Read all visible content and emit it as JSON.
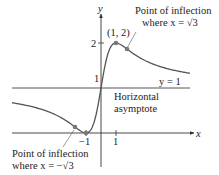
{
  "chart_data": {
    "type": "line",
    "title": "",
    "function": "f(x) = (x+1)^2 / (x^2+1)",
    "xlabel": "x",
    "ylabel": "y",
    "xlim": [
      -6.5,
      7.8
    ],
    "ylim": [
      -0.3,
      2.9
    ],
    "grid": false,
    "x_ticks": [
      {
        "value": -1,
        "label": "−1"
      },
      {
        "value": 1,
        "label": "1"
      }
    ],
    "y_ticks": [
      {
        "value": 1,
        "label": "1"
      },
      {
        "value": 2,
        "label": "2"
      }
    ],
    "series": [
      {
        "name": "f(x)",
        "x": [
          -6.5,
          -5,
          -4,
          -3,
          -2,
          -1.732,
          -1.5,
          -1,
          -0.5,
          0,
          0.5,
          1,
          1.5,
          1.732,
          2,
          3,
          4,
          5,
          6,
          7.8
        ],
        "y": [
          0.735,
          0.615,
          0.529,
          0.4,
          0.2,
          0.134,
          0.077,
          0.0,
          0.2,
          1.0,
          1.8,
          2.0,
          1.923,
          1.866,
          1.8,
          1.6,
          1.471,
          1.385,
          1.324,
          1.252
        ]
      }
    ],
    "points": [
      {
        "x": 1,
        "y": 2,
        "label": "(1, 2)"
      },
      {
        "x": -1,
        "y": 0,
        "label": ""
      },
      {
        "x": 1.732,
        "y": 1.866,
        "label": "Point of inflection where x = √3"
      },
      {
        "x": -1.732,
        "y": 0.134,
        "label": "Point of inflection where x = −√3"
      }
    ],
    "asymptote": {
      "y": 1,
      "label": "y = 1",
      "description": "Horizontal asymptote"
    }
  },
  "labels": {
    "y_axis": "y",
    "x_axis": "x",
    "max_point": "(1, 2)",
    "tick_y2": "2",
    "tick_y1": "1",
    "tick_x1": "1",
    "tick_xm1": "−1",
    "asymptote_eq": "y = 1",
    "asymptote_line1": "Horizontal",
    "asymptote_line2": "asymptote",
    "inflection_pos_line1": "Point of inflection",
    "inflection_pos_line2": "where x = √3",
    "inflection_neg_line1": "Point of inflection",
    "inflection_neg_line2": "where x = −√3"
  },
  "colors": {
    "curve": "#555555",
    "axis": "#333333",
    "point": "#777777",
    "text": "#222222"
  }
}
